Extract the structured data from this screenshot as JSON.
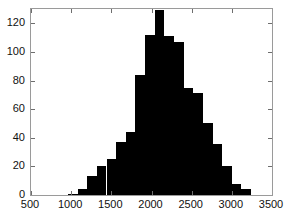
{
  "chart_data": {
    "type": "bar",
    "title": "",
    "subtitle": "",
    "xlabel": "",
    "ylabel": "",
    "xlim": [
      500,
      3500
    ],
    "ylim": [
      0,
      130
    ],
    "grid": false,
    "legend": null,
    "bar_width": 120,
    "xticks": [
      500,
      1000,
      1500,
      2000,
      2500,
      3000,
      3500
    ],
    "xtick_labels": [
      "500",
      "1000",
      "1500",
      "2000",
      "2500",
      "3000",
      "3500"
    ],
    "yticks": [
      0,
      20,
      40,
      60,
      80,
      100,
      120
    ],
    "ytick_labels": [
      "0",
      "20",
      "40",
      "60",
      "80",
      "100",
      "120"
    ],
    "categories": [
      1020,
      1140,
      1260,
      1380,
      1500,
      1620,
      1740,
      1860,
      1980,
      2100,
      2220,
      2340,
      2460,
      2580,
      2700,
      2820,
      2940,
      3060,
      3180
    ],
    "values": [
      1,
      4,
      13,
      20,
      25,
      37,
      44,
      84,
      112,
      129,
      111,
      107,
      75,
      71,
      50,
      36,
      20,
      8,
      4
    ],
    "series": [
      {
        "name": "frequency",
        "values": [
          1,
          4,
          13,
          20,
          25,
          37,
          44,
          84,
          112,
          129,
          111,
          107,
          75,
          71,
          50,
          36,
          20,
          8,
          4
        ]
      }
    ],
    "bar_color": "#000000",
    "axes_color": "#9a9a9a",
    "background_color": "#ffffff"
  }
}
